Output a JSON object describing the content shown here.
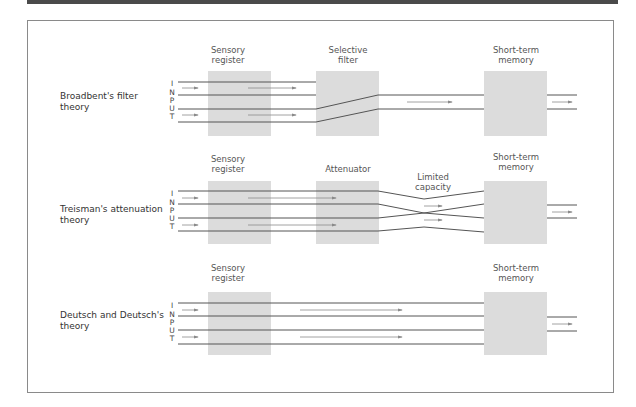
{
  "diagram": {
    "type": "attention-theories-flow",
    "input_label_letters": [
      "I",
      "N",
      "P",
      "U",
      "T"
    ],
    "colors": {
      "box_fill": "#dcdcdc",
      "line": "#555555",
      "arrow": "#8a8a8a",
      "frame": "#8a8a8a",
      "topbar": "#4a4a4a"
    },
    "rows": [
      {
        "theory": "Broadbent's filter theory",
        "theory_lines": [
          "Broadbent's filter",
          "theory"
        ],
        "stages": [
          {
            "label_lines": [
              "Sensory",
              "register"
            ]
          },
          {
            "label_lines": [
              "Selective",
              "filter"
            ]
          },
          {
            "label_lines": [
              "Short-term",
              "memory"
            ]
          }
        ]
      },
      {
        "theory": "Treisman's attenuation theory",
        "theory_lines": [
          "Treisman's attenuation",
          "theory"
        ],
        "stages": [
          {
            "label_lines": [
              "Sensory",
              "register"
            ]
          },
          {
            "label_lines": [
              "Attenuator"
            ]
          },
          {
            "label_lines": [
              "Limited",
              "capacity"
            ]
          },
          {
            "label_lines": [
              "Short-term",
              "memory"
            ]
          }
        ]
      },
      {
        "theory": "Deutsch and Deutsch's theory",
        "theory_lines": [
          "Deutsch and Deutsch's",
          "theory"
        ],
        "stages": [
          {
            "label_lines": [
              "Sensory",
              "register"
            ]
          },
          {
            "label_lines": [
              "Short-term",
              "memory"
            ]
          }
        ]
      }
    ]
  }
}
